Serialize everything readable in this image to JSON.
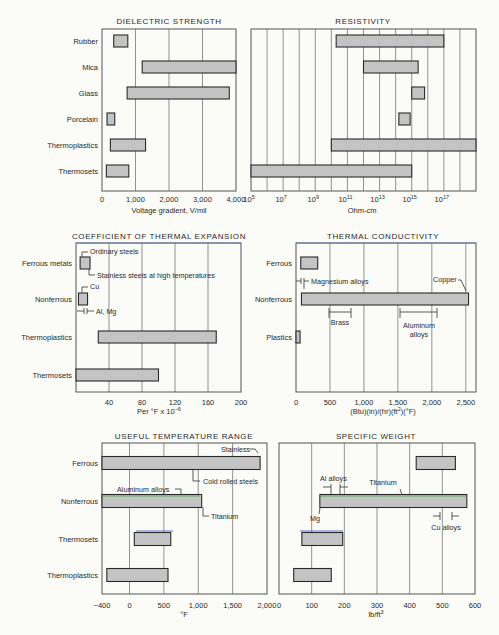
{
  "chart_data": [
    {
      "id": "dielectric",
      "type": "bar",
      "orientation": "horizontal-range",
      "title": "DIELECTRIC STRENGTH",
      "xlabel": "Voltage gradient, V/mil",
      "ylabel": "",
      "xlim": [
        0,
        4000
      ],
      "xticks": [
        0,
        1000,
        2000,
        3000,
        4000
      ],
      "xtick_labels": [
        "0",
        "1,000",
        "2,000",
        "3,000",
        "4,000"
      ],
      "grid": true,
      "categories": [
        "Rubber",
        "Mica",
        "Glass",
        "Porcelain",
        "Thermoplastics",
        "Thermosets"
      ],
      "ranges": [
        [
          350,
          770
        ],
        [
          1200,
          4000
        ],
        [
          750,
          3800
        ],
        [
          150,
          380
        ],
        [
          250,
          1300
        ],
        [
          130,
          800
        ]
      ],
      "annotations": []
    },
    {
      "id": "resistivity",
      "type": "bar",
      "orientation": "horizontal-range",
      "title": "RESISTIVITY",
      "xlabel": "Ohm-cm",
      "xscale": "log",
      "xlim_exponent": [
        5,
        19
      ],
      "xticks_exponent": [
        5,
        7,
        9,
        11,
        13,
        15,
        17
      ],
      "xtick_labels": [
        "10^5",
        "10^7",
        "10^9",
        "10^11",
        "10^13",
        "10^15",
        "10^17"
      ],
      "grid": true,
      "categories": [
        "Rubber",
        "Mica",
        "Glass",
        "Porcelain",
        "Thermoplastics",
        "Thermosets"
      ],
      "ranges_exponent": [
        [
          10.3,
          17
        ],
        [
          12,
          15.4
        ],
        [
          15,
          15.8
        ],
        [
          14.2,
          14.9
        ],
        [
          10,
          19
        ],
        [
          5,
          15
        ]
      ],
      "annotations": []
    },
    {
      "id": "thermal_expansion",
      "type": "bar",
      "orientation": "horizontal-range",
      "title": "COEFFICIENT OF THERMAL EXPANSION",
      "xlabel": "Per °F x 10^-6",
      "xlim": [
        0,
        200
      ],
      "xticks": [
        40,
        80,
        120,
        160,
        200
      ],
      "xtick_labels": [
        "40",
        "80",
        "120",
        "160",
        "200"
      ],
      "grid": true,
      "categories": [
        "Ferrous metals",
        "Nonferrous",
        "Thermoplastics",
        "Thermosets"
      ],
      "ranges": [
        [
          5,
          17
        ],
        [
          3,
          14
        ],
        [
          27,
          170
        ],
        [
          0,
          100
        ]
      ],
      "annotations": [
        {
          "text": "Ordinary steels",
          "category": "Ferrous metals",
          "at": 6
        },
        {
          "text": "Stainless steels at high temperatures",
          "category": "Ferrous metals",
          "at": 10
        },
        {
          "text": "Cu",
          "category": "Nonferrous",
          "at": 8
        },
        {
          "text": "Al, Mg",
          "category": "Nonferrous",
          "range": [
            10,
            14
          ]
        }
      ]
    },
    {
      "id": "thermal_conductivity",
      "type": "bar",
      "orientation": "horizontal-range",
      "title": "THERMAL CONDUCTIVITY",
      "xlabel": "(Btu)(in)/(hr)(ft²)(°F)",
      "xlim": [
        0,
        2650
      ],
      "xticks": [
        0,
        500,
        1000,
        1500,
        2000,
        2500
      ],
      "xtick_labels": [
        "0",
        "500",
        "1,000",
        "1,500",
        "2,000",
        "2,500"
      ],
      "grid": true,
      "categories": [
        "Ferrous",
        "Nonferrous",
        "Plastics"
      ],
      "ranges": [
        [
          70,
          320
        ],
        [
          80,
          2540
        ],
        [
          0,
          60
        ]
      ],
      "annotations": [
        {
          "text": "Magnesium alloys",
          "category": "Nonferrous",
          "range": [
            75,
            120
          ]
        },
        {
          "text": "Copper",
          "category": "Nonferrous",
          "at": 2540
        },
        {
          "text": "Brass",
          "category": "Nonferrous",
          "range": [
            500,
            830
          ]
        },
        {
          "text": "Aluminum alloys",
          "category": "Nonferrous",
          "range": [
            1560,
            2120
          ]
        }
      ]
    },
    {
      "id": "temperature_range",
      "type": "bar",
      "orientation": "horizontal-range",
      "title": "USEFUL TEMPERATURE RANGE",
      "xlabel": "°F",
      "xlim": [
        -400,
        2000
      ],
      "xticks": [
        -400,
        0,
        500,
        1000,
        1500,
        2000
      ],
      "xtick_labels": [
        "−400",
        "0",
        "500",
        "1,000",
        "1,500",
        "2,000"
      ],
      "grid": true,
      "categories": [
        "Ferrous",
        "Nonferrous",
        "Thermosets",
        "Thermoplastics"
      ],
      "ranges": [
        [
          -400,
          1900
        ],
        [
          -400,
          1050
        ],
        [
          70,
          600
        ],
        [
          -330,
          560
        ]
      ],
      "annotations": [
        {
          "text": "Stainless",
          "category": "Ferrous",
          "at": 1900
        },
        {
          "text": "Cold rolled steels",
          "category": "Ferrous",
          "at": 900
        },
        {
          "text": "Aluminum alloys",
          "category": "Nonferrous",
          "at": 700
        },
        {
          "text": "Titanium",
          "category": "Nonferrous",
          "at": 1050
        }
      ]
    },
    {
      "id": "specific_weight",
      "type": "bar",
      "orientation": "horizontal-range",
      "title": "SPECIFIC WEIGHT",
      "xlabel": "lb/ft³",
      "xlim": [
        0,
        600
      ],
      "xticks": [
        0,
        100,
        200,
        300,
        400,
        500,
        600
      ],
      "xtick_labels": [
        "0",
        "100",
        "200",
        "300",
        "400",
        "500",
        "600"
      ],
      "grid": true,
      "categories": [
        "Ferrous",
        "Nonferrous",
        "Thermosets",
        "Thermoplastics"
      ],
      "ranges": [
        [
          420,
          540
        ],
        [
          125,
          575
        ],
        [
          70,
          195
        ],
        [
          45,
          160
        ]
      ],
      "annotations": [
        {
          "text": "Al alloys",
          "category": "Nonferrous",
          "range": [
            165,
            190
          ]
        },
        {
          "text": "Titanium",
          "category": "Nonferrous",
          "at": 380
        },
        {
          "text": "Mg",
          "category": "Nonferrous",
          "at": 125
        },
        {
          "text": "Cu alloys",
          "category": "Nonferrous",
          "range": [
            505,
            545
          ]
        }
      ]
    }
  ]
}
